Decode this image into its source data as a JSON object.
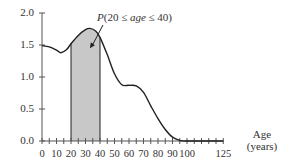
{
  "chart_data": {
    "type": "line",
    "title": "",
    "xlabel": "Age (years)",
    "xlabel_line1": "Age",
    "xlabel_line2": "(years)",
    "ylabel": "",
    "xlim": [
      0,
      125
    ],
    "ylim": [
      0,
      2.0
    ],
    "grid": false,
    "x_ticks": [
      0,
      10,
      20,
      30,
      40,
      50,
      60,
      70,
      80,
      90,
      100,
      125
    ],
    "x_tick_labels": [
      "0",
      "10",
      "20",
      "30",
      "40",
      "50",
      "60",
      "70",
      "80",
      "90",
      "100",
      "125"
    ],
    "x_minor_tick_step": 5,
    "y_ticks": [
      0.0,
      0.5,
      1.0,
      1.5,
      2.0
    ],
    "y_tick_labels": [
      "0.0",
      "0.5",
      "1.0",
      "1.5",
      "2.0"
    ],
    "series": [
      {
        "name": "density",
        "x": [
          0,
          5,
          10,
          13,
          17,
          20,
          25,
          30,
          33,
          37,
          40,
          45,
          50,
          55,
          60,
          65,
          70,
          75,
          80,
          85,
          90,
          95,
          100,
          125
        ],
        "values": [
          1.49,
          1.47,
          1.42,
          1.38,
          1.43,
          1.52,
          1.65,
          1.74,
          1.76,
          1.72,
          1.62,
          1.35,
          1.05,
          0.88,
          0.87,
          0.86,
          0.76,
          0.55,
          0.35,
          0.18,
          0.06,
          0.01,
          0.0,
          0.0
        ]
      }
    ],
    "shaded_region": {
      "from": 20,
      "to": 40,
      "color": "#c8c8c8"
    },
    "annotation": {
      "text": "P(20 ≤ age ≤ 40)",
      "prefix": "P(20 ≤ ",
      "var": "age",
      "suffix": " ≤ 40)",
      "arrow_to": [
        33,
        1.45
      ]
    },
    "colors": {
      "line": "#231f20",
      "shade": "#c8c8c8",
      "axis": "#555555"
    }
  }
}
